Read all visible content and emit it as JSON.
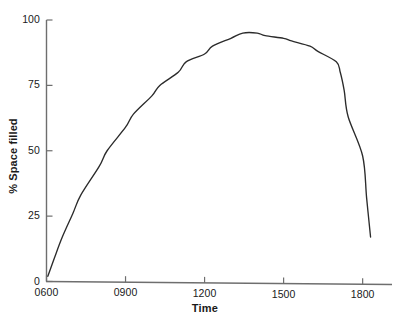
{
  "chart_data": {
    "type": "line",
    "title": "",
    "xlabel": "Time",
    "ylabel": "% Space filled",
    "xlim": [
      600,
      1900
    ],
    "ylim": [
      0,
      100
    ],
    "grid": false,
    "legend": null,
    "xtick_labels": [
      "0600",
      "0900",
      "1200",
      "1500",
      "1800"
    ],
    "xtick_values": [
      600,
      900,
      1200,
      1500,
      1800
    ],
    "ytick_labels": [
      "0",
      "25",
      "50",
      "75",
      "100"
    ],
    "ytick_values": [
      0,
      25,
      50,
      75,
      100
    ],
    "series": [
      {
        "name": "% Space filled",
        "color": "#2b2b2b",
        "x": [
          605,
          630,
          660,
          700,
          730,
          800,
          830,
          900,
          930,
          1000,
          1030,
          1100,
          1130,
          1200,
          1230,
          1300,
          1345,
          1400,
          1430,
          1500,
          1530,
          1600,
          1630,
          1700,
          1715,
          1730,
          1745,
          1800,
          1815,
          1830
        ],
        "y": [
          2,
          9,
          17,
          26,
          33,
          44,
          50,
          59,
          64,
          71,
          75,
          80,
          84,
          87,
          90,
          93,
          95,
          95,
          94,
          93,
          92,
          90,
          88,
          84,
          80,
          73,
          63,
          48,
          32,
          17
        ]
      }
    ]
  },
  "axes": {
    "y_label_text": "% Space filled",
    "x_label_text": "Time"
  }
}
